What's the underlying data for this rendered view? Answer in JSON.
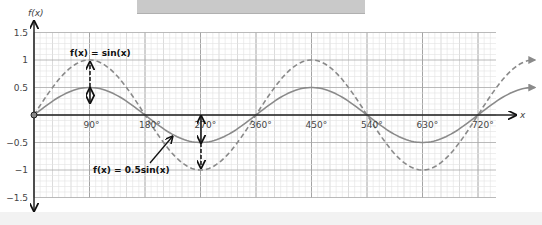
{
  "chart_data": {
    "type": "line",
    "title": "",
    "xlabel": "x",
    "ylabel": "f(x)",
    "xlim": [
      0,
      810
    ],
    "ylim": [
      -1.5,
      1.5
    ],
    "grid": true,
    "x_ticks": [
      "90°",
      "180°",
      "270°",
      "360°",
      "450°",
      "540°",
      "630°",
      "720°"
    ],
    "y_ticks": [
      "1.5",
      "1",
      "0.5",
      "-0.5",
      "-1",
      "-1.5"
    ],
    "series": [
      {
        "name": "f(x) = sin(x)",
        "style": "dashed",
        "color": "#8a8a8a",
        "x": [
          0,
          90,
          180,
          270,
          360,
          450,
          540,
          630,
          720,
          810
        ],
        "values": [
          0,
          1,
          0,
          -1,
          0,
          1,
          0,
          -1,
          0,
          1
        ]
      },
      {
        "name": "f(x) = 0.5sin(x)",
        "style": "solid",
        "color": "#8a8a8a",
        "x": [
          0,
          90,
          180,
          270,
          360,
          450,
          540,
          630,
          720,
          810
        ],
        "values": [
          0,
          0.5,
          0,
          -0.5,
          0,
          0.5,
          0,
          -0.5,
          0,
          0.5
        ]
      }
    ],
    "annotations": [
      {
        "text": "f(x) = sin(x)",
        "points_to": "sin(x) at 90°"
      },
      {
        "text": "f(x) = 0.5sin(x)",
        "points_to": "0.5sin(x) near 240°"
      },
      {
        "text": "vertical double arrows at 90° and 270° showing stretch from 0.5 to 1"
      }
    ]
  },
  "labels": {
    "y_axis": "f(x)",
    "x_axis": "x",
    "sin_label": "f(x) = sin(x)",
    "half_sin_label": "f(x) = 0.5sin(x)"
  }
}
